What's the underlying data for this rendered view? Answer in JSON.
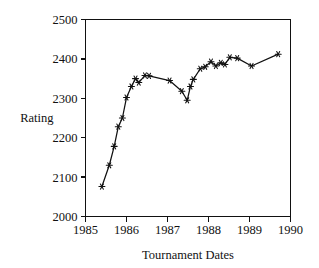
{
  "chart_data": {
    "type": "line",
    "title": "",
    "xlabel": "Tournament Dates",
    "ylabel": "Rating",
    "xlim": [
      1985,
      1990
    ],
    "ylim": [
      2000,
      2500
    ],
    "xticks": [
      1985,
      1986,
      1987,
      1988,
      1989,
      1990
    ],
    "xticklabels": [
      "1985",
      "1986",
      "1987",
      "1988",
      "1989",
      "1990"
    ],
    "yticks": [
      2000,
      2100,
      2200,
      2300,
      2400,
      2500
    ],
    "yticklabels": [
      "2000",
      "2100",
      "2200",
      "2300",
      "2400",
      "2500"
    ],
    "grid": false,
    "legend": null,
    "marker": "asterisk",
    "line_color": "#111111",
    "series": [
      {
        "name": "Rating",
        "x": [
          1985.4,
          1985.58,
          1985.7,
          1985.8,
          1985.9,
          1986.0,
          1986.12,
          1986.22,
          1986.3,
          1986.45,
          1986.55,
          1987.05,
          1987.35,
          1987.48,
          1987.56,
          1987.63,
          1987.8,
          1987.92,
          1988.06,
          1988.18,
          1988.3,
          1988.4,
          1988.52,
          1988.7,
          1989.05,
          1989.7
        ],
        "y": [
          2076,
          2130,
          2178,
          2228,
          2250,
          2302,
          2330,
          2350,
          2340,
          2358,
          2357,
          2345,
          2318,
          2295,
          2330,
          2348,
          2375,
          2380,
          2393,
          2382,
          2390,
          2386,
          2404,
          2402,
          2382,
          2412
        ]
      }
    ]
  }
}
